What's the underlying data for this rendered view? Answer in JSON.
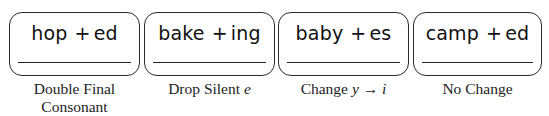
{
  "cards": [
    {
      "word": "hop",
      "plus": "+",
      "suffix": "ed",
      "answer": "",
      "rule_line1": "Double Final",
      "rule_line2": "Consonant"
    },
    {
      "word": "bake",
      "plus": "+",
      "suffix": "ing",
      "answer": "",
      "rule_text": "Drop Silent ",
      "rule_var": "e"
    },
    {
      "word": "baby",
      "plus": "+",
      "suffix": "es",
      "answer": "",
      "rule_text": "Change ",
      "rule_var": "y",
      "rule_arrow": "→",
      "rule_var2": "i"
    },
    {
      "word": "camp",
      "plus": "+",
      "suffix": "ed",
      "answer": "",
      "rule_text": "No Change"
    }
  ]
}
